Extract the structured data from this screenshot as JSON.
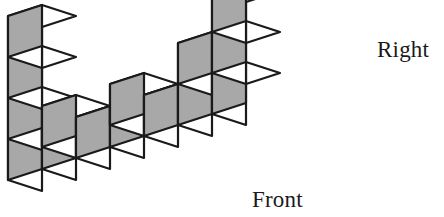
{
  "figure": {
    "type": "isometric-cube-stack-diagram",
    "title": "",
    "labels": {
      "right": "Right",
      "front": "Front"
    },
    "colors": {
      "top_face": "#ffffff",
      "left_face": "#ffffff",
      "right_face": "#a8a8a8",
      "outline": "#1a1a1a",
      "background": "#ffffff",
      "text": "#1a1a1a"
    },
    "projection": {
      "cube_size_px": 34,
      "dx_x": 34,
      "dx_y": -11,
      "dy_x": 34,
      "dy_y": 11,
      "dz_y": -41,
      "origin_x": 8,
      "origin_y": 180
    },
    "cubes": [
      {
        "x": 0,
        "y": 0,
        "z": 0
      },
      {
        "x": 0,
        "y": 0,
        "z": 1
      },
      {
        "x": 0,
        "y": 0,
        "z": 2
      },
      {
        "x": 0,
        "y": 0,
        "z": 3
      },
      {
        "x": 1,
        "y": 0,
        "z": 0
      },
      {
        "x": 2,
        "y": 0,
        "z": 0
      },
      {
        "x": 3,
        "y": 0,
        "z": 0
      },
      {
        "x": 4,
        "y": 0,
        "z": 0
      },
      {
        "x": 5,
        "y": 0,
        "z": 0
      },
      {
        "x": 6,
        "y": 0,
        "z": 0
      },
      {
        "x": 6,
        "y": 0,
        "z": 1
      },
      {
        "x": 6,
        "y": 0,
        "z": 2
      },
      {
        "x": 2,
        "y": -1,
        "z": 0
      },
      {
        "x": 4,
        "y": -1,
        "z": 0
      },
      {
        "x": 5,
        "y": 0,
        "z": 1
      }
    ],
    "counts": {
      "left_tower_height": 4,
      "right_tower_height": 3,
      "base_row_length": 7,
      "step_height": 1
    }
  }
}
